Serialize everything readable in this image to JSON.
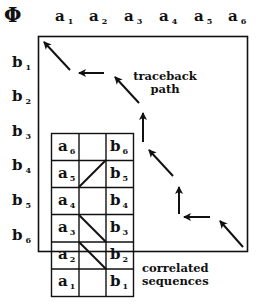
{
  "diagram": {
    "title_symbol": "Φ",
    "columns": [
      {
        "base": "a",
        "sub": "1"
      },
      {
        "base": "a",
        "sub": "2"
      },
      {
        "base": "a",
        "sub": "3"
      },
      {
        "base": "a",
        "sub": "4"
      },
      {
        "base": "a",
        "sub": "5"
      },
      {
        "base": "a",
        "sub": "6"
      }
    ],
    "rows": [
      {
        "base": "b",
        "sub": "1"
      },
      {
        "base": "b",
        "sub": "2"
      },
      {
        "base": "b",
        "sub": "3"
      },
      {
        "base": "b",
        "sub": "4"
      },
      {
        "base": "b",
        "sub": "5"
      },
      {
        "base": "b",
        "sub": "6"
      }
    ],
    "traceback_label": [
      "traceback",
      "path"
    ],
    "correlated_label": [
      "correlated",
      "sequences"
    ],
    "alignment_table": {
      "rows": [
        {
          "left": {
            "base": "a",
            "sub": "6"
          },
          "right": {
            "base": "b",
            "sub": "6"
          }
        },
        {
          "left": {
            "base": "a",
            "sub": "5"
          },
          "right": {
            "base": "b",
            "sub": "5"
          }
        },
        {
          "left": {
            "base": "a",
            "sub": "4"
          },
          "right": {
            "base": "b",
            "sub": "4"
          }
        },
        {
          "left": {
            "base": "a",
            "sub": "3"
          },
          "right": {
            "base": "b",
            "sub": "3"
          }
        },
        {
          "left": {
            "base": "a",
            "sub": "2"
          },
          "right": {
            "base": "b",
            "sub": "2"
          }
        },
        {
          "left": {
            "base": "a",
            "sub": "1"
          },
          "right": {
            "base": "b",
            "sub": "1"
          }
        }
      ],
      "links": [
        "a5-b6",
        "a3-b4",
        "a2-b3"
      ]
    },
    "traceback_arrows": [
      "diagonal",
      "left",
      "diagonal",
      "up",
      "diagonal",
      "up",
      "left",
      "diagonal"
    ],
    "colors": {
      "ink": "#111111",
      "background": "#ffffff"
    }
  }
}
